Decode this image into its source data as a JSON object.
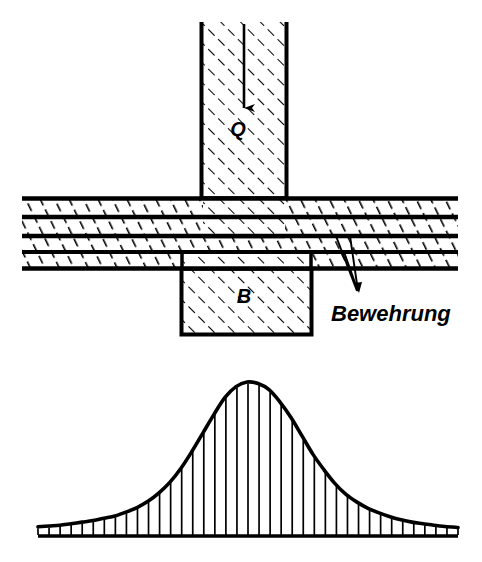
{
  "figure": {
    "background_color": "#ffffff",
    "line_color": "#000000",
    "width": 482,
    "height": 562
  },
  "labels": {
    "load_arrow": "Q",
    "reaction_block": "B",
    "reinforcement": "Bewehrung"
  },
  "upper_diagram": {
    "name": "slab-column-section",
    "column": {
      "name": "column-above",
      "label": "Q",
      "x": 200,
      "y": 22,
      "width": 88,
      "height": 178,
      "hatch": "diagonal-45"
    },
    "support_block": {
      "name": "support-block-below",
      "label": "B",
      "x": 180,
      "y": 266,
      "width": 132,
      "height": 70,
      "hatch": "diagonal-45"
    },
    "slab": {
      "name": "concrete-slab",
      "x": 22,
      "y": 197,
      "width": 436,
      "height": 73,
      "bands": 4,
      "rebar_layers": 5,
      "hatch": "diagonal-shallow"
    },
    "load_arrow": {
      "name": "load-arrow-q",
      "from_y": 24,
      "to_y": 112,
      "x": 244,
      "direction": "down"
    },
    "leader_lines": {
      "name": "reinforcement-leader-lines",
      "count": 2,
      "target_x": 360,
      "target_y": 294
    }
  },
  "chart_data": {
    "type": "area",
    "xlabel": "",
    "ylabel": "",
    "curve_name": "stress-distribution",
    "baseline_y": 536,
    "peak_y": 382,
    "x_start": 38,
    "x_end": 458,
    "peak_x": 246,
    "grid": false,
    "legend": false,
    "hatch_ticks": 38,
    "x": [
      38,
      49,
      60,
      71,
      82,
      93,
      104,
      115,
      126,
      137,
      148,
      159,
      170,
      181,
      192,
      203,
      214,
      225,
      236,
      247,
      258,
      269,
      280,
      291,
      302,
      313,
      324,
      335,
      346,
      357,
      368,
      379,
      390,
      401,
      412,
      423,
      434,
      445,
      458
    ],
    "values": [
      0.06,
      0.065,
      0.07,
      0.08,
      0.09,
      0.1,
      0.115,
      0.13,
      0.155,
      0.185,
      0.225,
      0.28,
      0.35,
      0.44,
      0.55,
      0.67,
      0.79,
      0.9,
      0.97,
      1.0,
      0.99,
      0.95,
      0.87,
      0.77,
      0.65,
      0.53,
      0.43,
      0.34,
      0.27,
      0.22,
      0.18,
      0.15,
      0.125,
      0.105,
      0.09,
      0.08,
      0.07,
      0.062,
      0.055
    ],
    "ylim": [
      0,
      1
    ],
    "xlim": [
      38,
      458
    ]
  }
}
